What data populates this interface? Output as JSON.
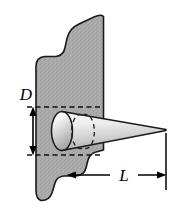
{
  "figure": {
    "background_color": "#ffffff",
    "parts": {
      "plate": {
        "name": "wavy-plate",
        "fill_color": "#ababab",
        "stroke_color": "#1a1a1a",
        "texture": "stipple"
      },
      "cone": {
        "name": "cone",
        "fill_light": "#fbfbfb",
        "fill_dark": "#b4b4b4",
        "stroke_color": "#1a1a1a",
        "base_ellipse_style": "dashed"
      }
    },
    "dimensions": [
      {
        "id": "diameter",
        "label": "D",
        "orientation": "vertical",
        "arrow_style": "double-headed",
        "extension_line_style": "dashed"
      },
      {
        "id": "length",
        "label": "L",
        "orientation": "horizontal",
        "arrow_style": "double-headed",
        "extension_line_style": "solid"
      }
    ]
  }
}
